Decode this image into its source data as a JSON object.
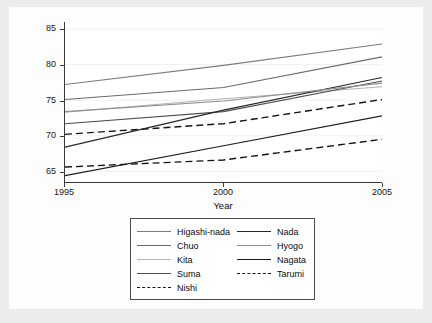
{
  "chart_data": {
    "type": "line",
    "title": "",
    "xlabel": "Year",
    "ylabel": "Tertiary industries working\npopulation (%)",
    "xlim": [
      1995,
      2005
    ],
    "ylim": [
      63.5,
      86
    ],
    "xticks": [
      1995,
      2000,
      2005
    ],
    "yticks": [
      65,
      70,
      75,
      80,
      85
    ],
    "xtick_labels": [
      "1995",
      "2000",
      "2005"
    ],
    "ytick_labels": [
      "65",
      "70",
      "75",
      "80",
      "85"
    ],
    "grid": true,
    "legend_position": "below-plot",
    "legend_columns": 2,
    "x": [
      1995,
      2000,
      2005
    ],
    "series": [
      {
        "name": "Higashi-nada",
        "values": [
          77.2,
          79.9,
          82.9
        ],
        "color": "#7d7d7d",
        "style": "solid",
        "width": 1.1
      },
      {
        "name": "Chuo",
        "values": [
          75.1,
          76.8,
          81.1
        ],
        "color": "#6a6a6a",
        "style": "solid",
        "width": 1.1
      },
      {
        "name": "Kita",
        "values": [
          73.3,
          75.2,
          76.9
        ],
        "color": "#b4b4b4",
        "style": "solid",
        "width": 1.1
      },
      {
        "name": "Suma",
        "values": [
          71.7,
          73.4,
          77.7
        ],
        "color": "#4f4f4f",
        "style": "solid",
        "width": 1.1
      },
      {
        "name": "Nishi",
        "values": [
          70.2,
          71.7,
          75.1
        ],
        "color": "#141414",
        "style": "dashed",
        "width": 1.4
      },
      {
        "name": "Nada",
        "values": [
          68.4,
          73.6,
          78.2
        ],
        "color": "#262626",
        "style": "solid",
        "width": 1.2
      },
      {
        "name": "Hyogo",
        "values": [
          73.4,
          74.9,
          77.4
        ],
        "color": "#8f8f8f",
        "style": "solid",
        "width": 1.1
      },
      {
        "name": "Nagata",
        "values": [
          64.4,
          68.6,
          72.8
        ],
        "color": "#1c1c1c",
        "style": "solid",
        "width": 1.2
      },
      {
        "name": "Tarumi",
        "values": [
          65.6,
          66.6,
          69.5
        ],
        "color": "#141414",
        "style": "dashed",
        "width": 1.4
      }
    ]
  },
  "legend": {
    "columns": [
      {
        "entries": [
          {
            "label": "Higashi-nada",
            "series": "Higashi-nada"
          },
          {
            "label": "Chuo",
            "series": "Chuo"
          },
          {
            "label": "Kita",
            "series": "Kita"
          },
          {
            "label": "Suma",
            "series": "Suma"
          },
          {
            "label": "Nishi",
            "series": "Nishi"
          }
        ]
      },
      {
        "entries": [
          {
            "label": "Nada",
            "series": "Nada"
          },
          {
            "label": "Hyogo",
            "series": "Hyogo"
          },
          {
            "label": "Nagata",
            "series": "Nagata"
          },
          {
            "label": "Tarumi",
            "series": "Tarumi"
          }
        ]
      }
    ]
  },
  "colors": {
    "figure_background": "#ececec",
    "canvas_background": "#fdfdfd",
    "plot_background": "#ffffff",
    "axis": "#3a3a3a",
    "grid": "#f0f0f0",
    "text": "#0d0d0d",
    "legend_border": "#4a4a4a"
  }
}
